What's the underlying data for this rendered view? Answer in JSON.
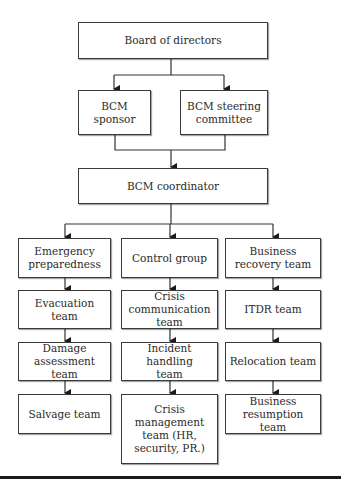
{
  "diagram": {
    "type": "org-chart",
    "nodes": {
      "board": "Board of directors",
      "sponsor": "BCM\nsponsor",
      "steering": "BCM steering\ncommittee",
      "coordinator": "BCM coordinator",
      "col1": [
        "Emergency\npreparedness",
        "Evacuation team",
        "Damage\nassessment\nteam",
        "Salvage team"
      ],
      "col2": [
        "Control group",
        "Crisis\ncommunication\nteam",
        "Incident handling\nteam",
        "Crisis\nmanagement\nteam (HR,\nsecurity, PR.)"
      ],
      "col3": [
        "Business\nrecovery team",
        "ITDR team",
        "Relocation team",
        "Business\nresumption team"
      ]
    },
    "edges": [
      [
        "Board of directors",
        "BCM sponsor"
      ],
      [
        "Board of directors",
        "BCM steering committee"
      ],
      [
        "BCM sponsor",
        "BCM coordinator"
      ],
      [
        "BCM steering committee",
        "BCM coordinator"
      ],
      [
        "BCM coordinator",
        "Emergency preparedness"
      ],
      [
        "BCM coordinator",
        "Control group"
      ],
      [
        "BCM coordinator",
        "Business recovery team"
      ],
      [
        "Emergency preparedness",
        "Evacuation team"
      ],
      [
        "Evacuation team",
        "Damage assessment team"
      ],
      [
        "Damage assessment team",
        "Salvage team"
      ],
      [
        "Control group",
        "Crisis communication team"
      ],
      [
        "Crisis communication team",
        "Incident handling team"
      ],
      [
        "Incident handling team",
        "Crisis management team (HR, security, PR.)"
      ],
      [
        "Business recovery team",
        "ITDR team"
      ],
      [
        "ITDR team",
        "Relocation team"
      ],
      [
        "Relocation team",
        "Business resumption team"
      ]
    ]
  }
}
